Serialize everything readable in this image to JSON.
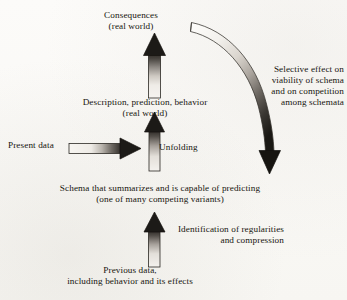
{
  "figure": {
    "kind": "flow-diagram",
    "title_text_present": false,
    "background_color": "#fbfaf8",
    "ink_color": "#17150f"
  },
  "labels": {
    "consequences": "Consequences\n(real world)",
    "description": "Description, prediction, behavior\n(real world)",
    "present_data": "Present data",
    "unfolding": "Unfolding",
    "selective_effect": "Selective effect on\nviability of schema\nand on competition\namong schemata",
    "schema": "Schema that summarizes and is capable of predicting\n(one of many competing variants)",
    "identification": "Identification of regularities\nand compression",
    "previous_data": "Previous data,\nincluding behavior and its effects"
  },
  "arrows": [
    {
      "id": "arrow-consequences",
      "name": "consequences-up-arrow",
      "direction": "up",
      "from_label": "description",
      "to_label": "consequences",
      "gradient": "light-bottom-to-dark-top",
      "head_color": "#1c1a17",
      "tail_color": "#f2f0ec"
    },
    {
      "id": "arrow-unfolding",
      "name": "unfolding-up-arrow",
      "direction": "up",
      "from_label": "schema",
      "to_label": "description",
      "gradient": "light-bottom-to-dark-top",
      "head_color": "#1c1a17",
      "tail_color": "#f2f0ec"
    },
    {
      "id": "arrow-present-data",
      "name": "present-data-right-arrow",
      "direction": "right",
      "from_label": "present_data",
      "to_label": "unfolding",
      "gradient": "light-left-to-dark-right",
      "head_color": "#1c1a17",
      "tail_color": "#f4f2ee"
    },
    {
      "id": "arrow-identification",
      "name": "identification-up-arrow",
      "direction": "up",
      "from_label": "previous_data",
      "to_label": "schema",
      "gradient": "light-bottom-to-dark-top",
      "head_color": "#1c1a17",
      "tail_color": "#f2f0ec"
    },
    {
      "id": "arrow-selective-effect",
      "name": "selective-effect-curved-arrow",
      "direction": "curved-down",
      "from_label": "consequences",
      "to_label": "schema",
      "gradient": "light-start-to-dark-end",
      "head_color": "#161410",
      "tail_color": "#fbfaf8"
    }
  ]
}
